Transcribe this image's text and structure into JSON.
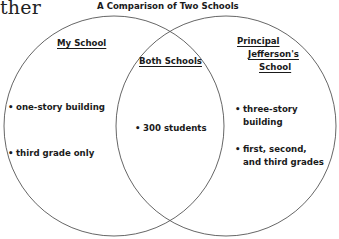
{
  "page_fragment": "ther",
  "diagram": {
    "title": "A Comparison of Two Schools",
    "type": "venn",
    "left_set": {
      "label": "My School",
      "items": [
        "one-story building",
        "third grade only"
      ]
    },
    "overlap": {
      "label": "Both Schools",
      "items": [
        "300 students"
      ]
    },
    "right_set": {
      "label_line1": "Principal",
      "label_line2": "Jefferson's",
      "label_line3": "School",
      "items": [
        {
          "line1": "three-story",
          "line2": "building"
        },
        {
          "line1": "first, second,",
          "line2": "and third grades"
        }
      ]
    },
    "bullet": "•",
    "circle_stroke_color": "#555555"
  }
}
